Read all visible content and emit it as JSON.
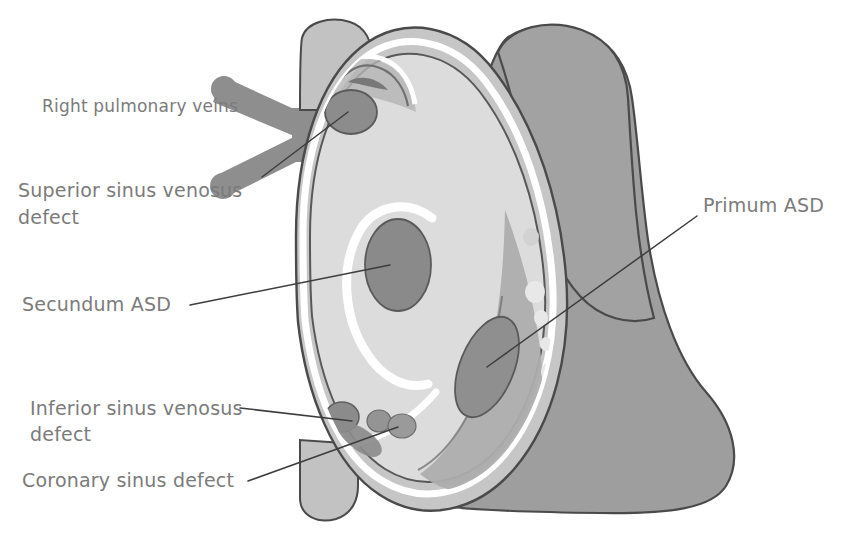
{
  "figure": {
    "width": 847,
    "height": 536,
    "background_color": "#ffffff"
  },
  "labels": [
    {
      "id": "right-pulmonary-veins",
      "text": "Right pulmonary veins",
      "x": 42,
      "y": 112,
      "anchor": "start",
      "size": "small"
    },
    {
      "id": "superior-sinus-venosus-defect",
      "text": "Superior sinus venosus",
      "text_line2": "defect",
      "x": 18,
      "y": 197,
      "anchor": "start",
      "size": "normal"
    },
    {
      "id": "secundum-asd",
      "text": "Secundum ASD",
      "x": 22,
      "y": 311,
      "anchor": "start",
      "size": "normal"
    },
    {
      "id": "inferior-sinus-venosus-defect",
      "text": "Inferior sinus venosus",
      "text_line2": "defect",
      "x": 30,
      "y": 415,
      "anchor": "start",
      "size": "normal"
    },
    {
      "id": "coronary-sinus-defect",
      "text": "Coronary sinus defect",
      "x": 22,
      "y": 487,
      "anchor": "start",
      "size": "normal"
    },
    {
      "id": "primum-asd",
      "text": "Primum ASD",
      "x": 703,
      "y": 212,
      "anchor": "start",
      "size": "normal"
    }
  ],
  "leader_lines": [
    {
      "id": "leader-superior-sinus-venosus",
      "points": "262,177 348,112"
    },
    {
      "id": "leader-secundum-asd",
      "points": "190,305 390,265"
    },
    {
      "id": "leader-inferior-sinus-venosus",
      "points": "240,408 352,421"
    },
    {
      "id": "leader-coronary-sinus",
      "points": "248,481 398,427"
    },
    {
      "id": "leader-primum-asd",
      "points": "697,216 487,367"
    }
  ],
  "anatomy": {
    "right_atrium_wall": {
      "name": "right-atrium-wall",
      "fill": "#c6c6c6",
      "stroke": "#4a4a4a"
    },
    "right_atrium_cavity": {
      "name": "right-atrium-cavity",
      "fill": "#dcdcdc",
      "stroke": "#555555"
    },
    "endocardium_highlight": {
      "name": "endocardium-highlight",
      "fill": "#ffffff"
    },
    "left_heart_mass": {
      "name": "left-heart-mass",
      "fill": "#9e9e9e",
      "stroke": "#4a4a4a"
    },
    "great_vessel": {
      "name": "great-vessel-trunk",
      "fill": "#a0a0a0",
      "stroke": "#4a4a4a"
    },
    "pulmonary_veins": {
      "name": "right-pulmonary-veins-vessel",
      "fill": "#8e8e8e"
    },
    "defects": [
      {
        "id": "defect-superior-sinus-venosus",
        "label": "Superior sinus venosus defect",
        "cx": 351,
        "cy": 112,
        "rx": 26,
        "ry": 22,
        "rotate": 0,
        "fill": "#8c8c8c"
      },
      {
        "id": "defect-secundum-asd",
        "label": "Secundum ASD",
        "cx": 398,
        "cy": 265,
        "rx": 33,
        "ry": 46,
        "rotate": 0,
        "fill": "#8a8a8a"
      },
      {
        "id": "defect-primum-asd",
        "label": "Primum ASD",
        "cx": 487,
        "cy": 367,
        "rx": 27,
        "ry": 53,
        "rotate": 22,
        "fill": "#8f8f8f"
      },
      {
        "id": "defect-inferior-sinus-venosus",
        "label": "Inferior sinus venosus defect",
        "cx": 342,
        "cy": 417,
        "rx": 17,
        "ry": 15,
        "rotate": 0,
        "fill": "#8b8b8b"
      },
      {
        "id": "defect-coronary-sinus-a",
        "label": "Coronary sinus defect",
        "cx": 379,
        "cy": 421,
        "rx": 12,
        "ry": 11,
        "rotate": 0,
        "fill": "#949494"
      },
      {
        "id": "defect-coronary-sinus-b",
        "label": "Coronary sinus defect",
        "cx": 402,
        "cy": 426,
        "rx": 14,
        "ry": 12,
        "rotate": 0,
        "fill": "#9a9a9a"
      }
    ],
    "limbus_ring": {
      "name": "limbus-fossa-ovalis-ring",
      "stroke": "#ffffff",
      "stroke_width": 9
    },
    "valve_nodules": {
      "name": "valve-nodules",
      "fill": "#e8e8e8"
    }
  },
  "caption": {
    "text": "",
    "visible": false
  },
  "colors": {
    "label_text": "#7b7b7b",
    "leader_line": "#3d3d3d",
    "outline": "#4a4a4a",
    "background": "#ffffff"
  }
}
